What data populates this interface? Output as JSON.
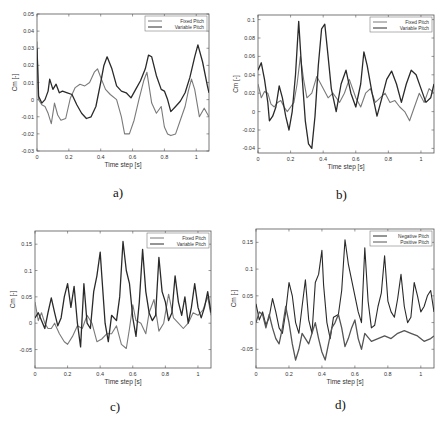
{
  "figure": {
    "captions": [
      "a)",
      "b)",
      "c)",
      "d)"
    ]
  },
  "chart_data": [
    {
      "id": "a",
      "type": "line",
      "caption": "a)",
      "xlabel": "Time step [s]",
      "ylabel": "Cm [-]",
      "xlim": [
        0,
        1.08
      ],
      "ylim": [
        -0.03,
        0.05
      ],
      "xticks": [
        0,
        0.2,
        0.4,
        0.6,
        0.8,
        1
      ],
      "xtick_labels": [
        "0",
        "0.2",
        "0.4",
        "0.6",
        "0.8",
        "1"
      ],
      "yticks": [
        -0.03,
        -0.02,
        -0.01,
        0,
        0.01,
        0.02,
        0.03,
        0.04,
        0.05
      ],
      "ytick_labels": [
        "-0.03",
        "-0.02",
        "-0.01",
        "0",
        "0.01",
        "0.02",
        "0.03",
        "0.04",
        "0.05"
      ],
      "legend": {
        "position": "top-right",
        "entries": [
          "Fixed Pitch",
          "Variable Pitch"
        ]
      },
      "grid": false,
      "series": [
        {
          "name": "Fixed Pitch",
          "color": "#7a7a7a",
          "x": [
            0,
            0.01,
            0.03,
            0.05,
            0.07,
            0.09,
            0.11,
            0.13,
            0.15,
            0.18,
            0.21,
            0.24,
            0.27,
            0.3,
            0.33,
            0.36,
            0.38,
            0.4,
            0.43,
            0.46,
            0.5,
            0.53,
            0.55,
            0.58,
            0.61,
            0.64,
            0.67,
            0.69,
            0.72,
            0.75,
            0.78,
            0.8,
            0.82,
            0.84,
            0.87,
            0.9,
            0.93,
            0.95,
            0.97,
            0.99,
            1.02,
            1.05,
            1.08
          ],
          "values": [
            0.034,
            0.0,
            -0.003,
            -0.004,
            -0.008,
            -0.014,
            -0.002,
            -0.009,
            -0.012,
            -0.011,
            0.001,
            0.007,
            0.009,
            0.008,
            0.01,
            0.016,
            0.018,
            0.013,
            0.006,
            0.003,
            0.0,
            -0.01,
            -0.02,
            -0.02,
            -0.012,
            0.0,
            0.011,
            0.016,
            -0.002,
            -0.008,
            -0.004,
            -0.016,
            -0.02,
            -0.021,
            -0.02,
            -0.012,
            -0.004,
            0.005,
            0.012,
            0.006,
            -0.01,
            -0.005,
            -0.01
          ]
        },
        {
          "name": "Variable Pitch",
          "color": "#2a2a2a",
          "x": [
            0,
            0.01,
            0.03,
            0.05,
            0.07,
            0.08,
            0.1,
            0.12,
            0.14,
            0.16,
            0.19,
            0.22,
            0.25,
            0.28,
            0.31,
            0.34,
            0.37,
            0.4,
            0.42,
            0.44,
            0.47,
            0.5,
            0.53,
            0.56,
            0.59,
            0.62,
            0.65,
            0.68,
            0.7,
            0.72,
            0.75,
            0.78,
            0.8,
            0.82,
            0.84,
            0.87,
            0.9,
            0.93,
            0.96,
            0.99,
            1.01,
            1.04,
            1.07,
            1.08
          ],
          "values": [
            0.03,
            0.002,
            -0.002,
            0.0,
            0.005,
            0.012,
            0.006,
            0.009,
            0.004,
            0.005,
            0.004,
            0.003,
            -0.003,
            -0.008,
            -0.011,
            -0.01,
            -0.004,
            0.01,
            0.02,
            0.025,
            0.018,
            0.008,
            0.005,
            0.004,
            0.001,
            0.006,
            0.011,
            0.018,
            0.026,
            0.025,
            0.014,
            0.006,
            0.005,
            0.0,
            -0.007,
            -0.004,
            -0.001,
            0.004,
            0.013,
            0.025,
            0.032,
            0.022,
            0.008,
            0.004
          ]
        }
      ]
    },
    {
      "id": "b",
      "type": "line",
      "caption": "b)",
      "xlabel": "Time step [s]",
      "ylabel": "Cm [-]",
      "xlim": [
        0,
        1.08
      ],
      "ylim": [
        -0.045,
        0.105
      ],
      "xticks": [
        0,
        0.2,
        0.4,
        0.6,
        0.8,
        1
      ],
      "xtick_labels": [
        "0",
        "0.2",
        "0.4",
        "0.6",
        "0.8",
        "1"
      ],
      "yticks": [
        -0.04,
        -0.02,
        0,
        0.02,
        0.04,
        0.06,
        0.08,
        0.1
      ],
      "ytick_labels": [
        "-0.04",
        "-0.02",
        "0",
        "0.02",
        "0.04",
        "0.06",
        "0.08",
        "0.1"
      ],
      "legend": {
        "position": "top-right",
        "entries": [
          "Fixed Pitch",
          "Variable Pitch"
        ]
      },
      "grid": false,
      "series": [
        {
          "name": "Fixed Pitch",
          "color": "#7a7a7a",
          "x": [
            0,
            0.02,
            0.04,
            0.06,
            0.08,
            0.1,
            0.12,
            0.14,
            0.16,
            0.18,
            0.2,
            0.22,
            0.24,
            0.26,
            0.28,
            0.3,
            0.33,
            0.36,
            0.38,
            0.4,
            0.43,
            0.46,
            0.5,
            0.53,
            0.56,
            0.6,
            0.63,
            0.66,
            0.69,
            0.72,
            0.75,
            0.78,
            0.81,
            0.84,
            0.87,
            0.9,
            0.93,
            0.96,
            0.99,
            1.02,
            1.05,
            1.08
          ],
          "values": [
            0.03,
            0.015,
            0.022,
            0.02,
            0.008,
            0.005,
            0.01,
            0.012,
            0.005,
            0.0,
            0.005,
            0.01,
            0.03,
            0.06,
            0.035,
            0.015,
            0.02,
            0.038,
            0.032,
            0.025,
            0.015,
            0.02,
            0.01,
            0.02,
            0.035,
            0.015,
            0.005,
            0.02,
            0.025,
            0.01,
            0.015,
            0.02,
            0.01,
            0.012,
            0.005,
            0.0,
            -0.01,
            0.005,
            0.02,
            0.01,
            0.025,
            0.02
          ]
        },
        {
          "name": "Variable Pitch",
          "color": "#2a2a2a",
          "x": [
            0,
            0.02,
            0.04,
            0.06,
            0.07,
            0.09,
            0.11,
            0.13,
            0.15,
            0.17,
            0.19,
            0.21,
            0.23,
            0.25,
            0.27,
            0.29,
            0.31,
            0.33,
            0.35,
            0.37,
            0.39,
            0.41,
            0.43,
            0.45,
            0.48,
            0.51,
            0.54,
            0.57,
            0.6,
            0.63,
            0.65,
            0.67,
            0.7,
            0.73,
            0.76,
            0.79,
            0.82,
            0.85,
            0.88,
            0.91,
            0.94,
            0.97,
            1.0,
            1.03,
            1.06,
            1.08
          ],
          "values": [
            0.045,
            0.053,
            0.035,
            0.01,
            -0.01,
            -0.005,
            0.005,
            0.028,
            0.015,
            -0.005,
            -0.02,
            0.0,
            0.04,
            0.098,
            0.04,
            -0.01,
            -0.035,
            -0.04,
            -0.005,
            0.05,
            0.09,
            0.095,
            0.06,
            0.025,
            0.0,
            0.03,
            0.045,
            0.02,
            0.005,
            0.03,
            0.065,
            0.05,
            0.02,
            -0.005,
            0.015,
            0.035,
            0.044,
            0.03,
            0.01,
            0.03,
            0.045,
            0.04,
            0.025,
            0.01,
            0.015,
            0.03
          ]
        }
      ]
    },
    {
      "id": "c",
      "type": "line",
      "caption": "c)",
      "xlabel": "Time step [s]",
      "ylabel": "Cm [-]",
      "xlim": [
        0,
        1.08
      ],
      "ylim": [
        -0.085,
        0.175
      ],
      "xticks": [
        0,
        0.2,
        0.4,
        0.6,
        0.8,
        1
      ],
      "xtick_labels": [
        "0",
        "0.2",
        "0.4",
        "0.6",
        "0.8",
        "1"
      ],
      "yticks": [
        -0.05,
        0,
        0.05,
        0.1,
        0.15
      ],
      "ytick_labels": [
        "-0.05",
        "0",
        "0.05",
        "0.1",
        "0.15"
      ],
      "legend": {
        "position": "top-right",
        "entries": [
          "Fixed Pitch",
          "Variable Pitch"
        ]
      },
      "grid": false,
      "series": [
        {
          "name": "Fixed Pitch",
          "color": "#7a7a7a",
          "x": [
            0,
            0.02,
            0.04,
            0.06,
            0.08,
            0.1,
            0.12,
            0.15,
            0.18,
            0.2,
            0.23,
            0.26,
            0.29,
            0.32,
            0.35,
            0.38,
            0.41,
            0.44,
            0.47,
            0.5,
            0.53,
            0.56,
            0.58,
            0.6,
            0.62,
            0.65,
            0.68,
            0.7,
            0.73,
            0.76,
            0.79,
            0.82,
            0.85,
            0.88,
            0.91,
            0.94,
            0.97,
            1.0,
            1.03,
            1.06,
            1.08
          ],
          "values": [
            0.04,
            0.005,
            0.02,
            0.0,
            -0.01,
            -0.01,
            0.0,
            -0.02,
            -0.035,
            -0.04,
            -0.025,
            -0.005,
            -0.01,
            0.015,
            0.0,
            -0.035,
            -0.03,
            -0.02,
            -0.02,
            -0.005,
            -0.04,
            -0.048,
            -0.01,
            0.035,
            0.005,
            0.0,
            -0.02,
            0.02,
            0.045,
            -0.015,
            0.0,
            0.055,
            0.01,
            0.0,
            -0.01,
            0.0,
            0.02,
            0.015,
            0.025,
            0.05,
            0.015
          ]
        },
        {
          "name": "Variable Pitch",
          "color": "#2a2a2a",
          "x": [
            0,
            0.02,
            0.04,
            0.06,
            0.08,
            0.1,
            0.12,
            0.14,
            0.16,
            0.18,
            0.2,
            0.22,
            0.24,
            0.26,
            0.28,
            0.3,
            0.32,
            0.34,
            0.36,
            0.38,
            0.4,
            0.41,
            0.43,
            0.45,
            0.47,
            0.5,
            0.52,
            0.54,
            0.56,
            0.58,
            0.6,
            0.62,
            0.64,
            0.66,
            0.68,
            0.7,
            0.72,
            0.74,
            0.76,
            0.78,
            0.8,
            0.82,
            0.84,
            0.86,
            0.88,
            0.9,
            0.92,
            0.94,
            0.96,
            0.98,
            1.0,
            1.02,
            1.04,
            1.06,
            1.08
          ],
          "values": [
            0.01,
            0.02,
            0.005,
            -0.01,
            0.02,
            0.048,
            0.02,
            -0.005,
            0.01,
            0.05,
            0.075,
            0.03,
            0.07,
            0.0,
            -0.045,
            0.075,
            0.0,
            -0.01,
            0.06,
            0.09,
            0.135,
            0.09,
            0.0,
            -0.035,
            0.015,
            0.005,
            0.05,
            0.155,
            0.1,
            0.075,
            0.01,
            -0.025,
            0.04,
            0.14,
            0.06,
            0.02,
            0.005,
            0.015,
            0.125,
            0.06,
            0.04,
            0.005,
            0.02,
            0.09,
            0.04,
            0.015,
            0.05,
            0.0,
            0.03,
            0.075,
            0.03,
            0.01,
            0.03,
            0.06,
            0.02
          ]
        }
      ]
    },
    {
      "id": "d",
      "type": "line",
      "caption": "d)",
      "xlabel": "Time step [s]",
      "ylabel": "Cm [-]",
      "xlim": [
        0,
        1.08
      ],
      "ylim": [
        -0.085,
        0.175
      ],
      "xticks": [
        0,
        0.2,
        0.4,
        0.6,
        0.8,
        1
      ],
      "xtick_labels": [
        "0",
        "0.2",
        "0.4",
        "0.6",
        "0.8",
        "1"
      ],
      "yticks": [
        -0.05,
        0,
        0.05,
        0.1,
        0.15
      ],
      "ytick_labels": [
        "-0.05",
        "0",
        "0.05",
        "0.1",
        "0.15"
      ],
      "legend": {
        "position": "top-right",
        "entries": [
          "Negative Pitch",
          "Positive Pitch"
        ]
      },
      "grid": false,
      "series": [
        {
          "name": "Negative Pitch",
          "color": "#2a2a2a",
          "x": [
            0,
            0.02,
            0.04,
            0.06,
            0.08,
            0.1,
            0.12,
            0.14,
            0.16,
            0.18,
            0.2,
            0.22,
            0.24,
            0.26,
            0.28,
            0.3,
            0.32,
            0.34,
            0.36,
            0.38,
            0.4,
            0.41,
            0.43,
            0.45,
            0.47,
            0.5,
            0.52,
            0.54,
            0.56,
            0.58,
            0.6,
            0.62,
            0.64,
            0.66,
            0.68,
            0.7,
            0.72,
            0.74,
            0.76,
            0.78,
            0.8,
            0.82,
            0.84,
            0.86,
            0.88,
            0.9,
            0.92,
            0.94,
            0.96,
            0.98,
            1.0,
            1.02,
            1.04,
            1.06,
            1.08
          ],
          "values": [
            0.035,
            0.005,
            0.02,
            -0.005,
            0.01,
            0.045,
            0.02,
            -0.01,
            -0.02,
            0.02,
            0.075,
            0.05,
            0.0,
            -0.02,
            0.03,
            0.08,
            0.005,
            -0.02,
            0.075,
            0.09,
            0.135,
            0.07,
            0.0,
            -0.03,
            0.01,
            0.015,
            0.06,
            0.155,
            0.11,
            0.08,
            0.05,
            0.02,
            0.0,
            0.14,
            0.04,
            -0.01,
            -0.005,
            0.03,
            0.055,
            0.125,
            0.04,
            0.02,
            0.01,
            0.045,
            0.09,
            0.03,
            0.0,
            0.01,
            0.075,
            0.05,
            0.02,
            0.03,
            0.05,
            0.06,
            0.02
          ]
        },
        {
          "name": "Positive Pitch",
          "color": "#555555",
          "x": [
            0,
            0.02,
            0.04,
            0.06,
            0.08,
            0.1,
            0.12,
            0.14,
            0.16,
            0.18,
            0.2,
            0.22,
            0.24,
            0.26,
            0.28,
            0.3,
            0.32,
            0.34,
            0.36,
            0.38,
            0.4,
            0.42,
            0.44,
            0.46,
            0.48,
            0.5,
            0.52,
            0.54,
            0.56,
            0.58,
            0.6,
            0.62,
            0.64,
            0.66,
            0.7,
            0.74,
            0.78,
            0.82,
            0.86,
            0.9,
            0.94,
            0.98,
            1.02,
            1.06,
            1.08
          ],
          "values": [
            0.0,
            0.02,
            0.015,
            -0.01,
            0.015,
            -0.01,
            -0.03,
            -0.04,
            -0.01,
            0.03,
            0.0,
            -0.04,
            -0.07,
            -0.05,
            -0.02,
            -0.03,
            -0.04,
            -0.02,
            0.0,
            -0.03,
            -0.055,
            -0.07,
            -0.04,
            -0.01,
            0.0,
            0.015,
            -0.01,
            -0.045,
            -0.03,
            -0.01,
            0.005,
            -0.03,
            -0.05,
            -0.02,
            -0.035,
            -0.03,
            -0.025,
            -0.03,
            -0.02,
            -0.015,
            -0.02,
            -0.025,
            -0.035,
            -0.03,
            -0.025
          ]
        }
      ]
    }
  ]
}
